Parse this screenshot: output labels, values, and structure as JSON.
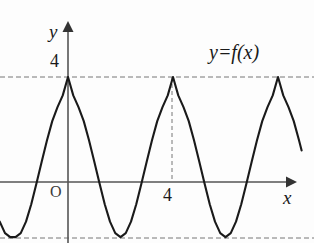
{
  "figure": {
    "kind": "coordinate-plane-graph",
    "background_color": "#fdfdfd",
    "curve_color": "#1a1a1a",
    "axis_color": "#555555",
    "dash_color": "#777777"
  },
  "axes": {
    "y_axis_label": "y",
    "x_axis_label": "x",
    "origin_label": "O",
    "y_tick_label": "4",
    "x_tick_label": "4",
    "x_axis_pixel_y": 182,
    "y_axis_pixel_x": 68,
    "units_per_pixel_x": 26.25,
    "units_per_pixel_y": 26.25
  },
  "annotations": {
    "function_label": "y=f(x)"
  },
  "chart_data": {
    "type": "line",
    "title": "",
    "xlabel": "x",
    "ylabel": "y",
    "function_label": "y=f(x)",
    "curve_form": "sinusoid",
    "amplitude": 3.05,
    "midline": 0.95,
    "period": 4,
    "phase": "maximum at x = 0",
    "maximum_value": 4,
    "minimum_value": -2.1,
    "xlim": [
      -2.6,
      9.4
    ],
    "ylim": [
      -2.4,
      6.1
    ],
    "grid": false,
    "legend": "none",
    "y_ticks": [
      4
    ],
    "x_ticks": [
      4
    ],
    "reference_lines": [
      {
        "name": "peak-dashed-line",
        "orientation": "horizontal",
        "value": 4
      },
      {
        "name": "trough-dashed-line",
        "orientation": "horizontal",
        "value": -2.1
      },
      {
        "name": "x4-dashed-line",
        "orientation": "vertical",
        "value": 4
      }
    ],
    "maxima_x": [
      0,
      4,
      8
    ],
    "minima_x": [
      -2,
      2,
      6
    ],
    "zero_crossings_x": [
      1.03,
      2.97,
      5.03,
      6.97
    ],
    "x": [
      -2.6,
      -2.4,
      -2.2,
      -2.0,
      -1.8,
      -1.6,
      -1.4,
      -1.2,
      -1.0,
      -0.8,
      -0.6,
      -0.4,
      -0.2,
      0.0,
      0.2,
      0.4,
      0.6,
      0.8,
      1.0,
      1.2,
      1.4,
      1.6,
      1.8,
      2.0,
      2.2,
      2.4,
      2.6,
      2.8,
      3.0,
      3.2,
      3.4,
      3.6,
      3.8,
      4.0,
      4.2,
      4.4,
      4.6,
      4.8,
      5.0,
      5.2,
      5.4,
      5.6,
      5.8,
      6.0,
      6.2,
      6.4,
      6.6,
      6.8,
      7.0,
      7.2,
      7.4,
      7.6,
      7.8,
      8.0,
      8.2,
      8.4,
      8.6,
      8.8,
      8.9
    ],
    "y": [
      -1.51,
      -1.95,
      -2.1,
      -2.1,
      -1.95,
      -1.51,
      -0.85,
      -0.05,
      0.78,
      1.59,
      2.32,
      2.85,
      3.3,
      4.0,
      3.3,
      2.85,
      2.32,
      1.59,
      0.78,
      -0.05,
      -0.85,
      -1.51,
      -1.95,
      -2.1,
      -1.95,
      -1.51,
      -0.85,
      -0.05,
      0.78,
      1.59,
      2.32,
      2.85,
      3.3,
      4.0,
      3.3,
      2.85,
      2.32,
      1.59,
      0.78,
      -0.05,
      -0.85,
      -1.51,
      -1.95,
      -2.1,
      -1.95,
      -1.51,
      -0.85,
      -0.05,
      0.78,
      1.59,
      2.32,
      2.85,
      3.3,
      4.0,
      3.3,
      2.85,
      2.32,
      1.59,
      1.2
    ]
  }
}
